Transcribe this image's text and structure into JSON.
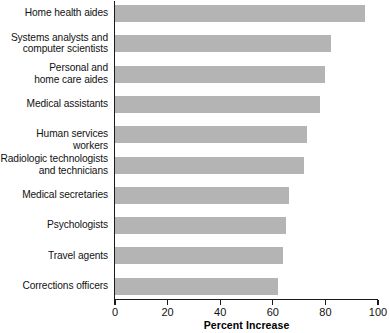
{
  "chart_data": {
    "type": "bar",
    "orientation": "horizontal",
    "title": "",
    "xlabel": "Percent Increase",
    "ylabel": "",
    "xlim": [
      0,
      100
    ],
    "xticks": [
      0,
      20,
      40,
      60,
      80,
      100
    ],
    "xtick_labels": [
      "0",
      "20",
      "40",
      "60",
      "80",
      "100"
    ],
    "grid": false,
    "legend": false,
    "bar_color": "#b4b4b4",
    "axis_color": "#1a1a1a",
    "categories": [
      "Home health aides",
      "Systems analysts and\ncomputer scientists",
      "Personal and\nhome care aides",
      "Medical assistants",
      "Human services workers",
      "Radiologic technologists\nand technicians",
      "Medical secretaries",
      "Psychologists",
      "Travel agents",
      "Corrections officers"
    ],
    "values": [
      95,
      82,
      80,
      78,
      73,
      72,
      66,
      65,
      64,
      62
    ]
  }
}
